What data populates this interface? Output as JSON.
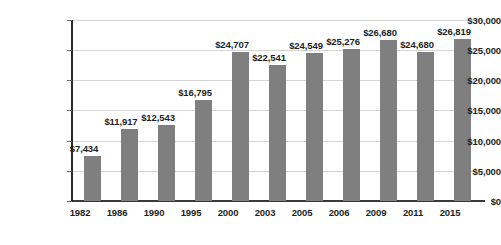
{
  "chart_data": {
    "type": "bar",
    "title": "",
    "subtitle": "",
    "xlabel": "",
    "ylabel": "",
    "categories": [
      "1982",
      "1986",
      "1990",
      "1995",
      "2000",
      "2003",
      "2005",
      "2006",
      "2009",
      "2011",
      "2015"
    ],
    "values": [
      7434,
      11917,
      12543,
      16795,
      24707,
      22541,
      24549,
      25276,
      26680,
      24680,
      26819
    ],
    "data_labels": [
      "$7,434",
      "$11,917",
      "$12,543",
      "$16,795",
      "$24,707",
      "$22,541",
      "$24,549",
      "$25,276",
      "$26,680",
      "$24,680",
      "$26,819"
    ],
    "ylim": [
      0,
      30000
    ],
    "ytick_values": [
      0,
      5000,
      10000,
      15000,
      20000,
      25000,
      30000
    ],
    "ytick_labels": [
      "$0",
      "$5,000",
      "$10,000",
      "$15,000",
      "$20,000",
      "$25,000",
      "$30,000"
    ],
    "grid": true,
    "grid_axis": "y",
    "legend": false,
    "legend_position": "none",
    "bar_color": "#7f7f7f",
    "gridline_color": "#d4d4d4",
    "axis_color": "#2b2b2b",
    "text_color": "#231f20",
    "background_color": "#ffffff"
  }
}
